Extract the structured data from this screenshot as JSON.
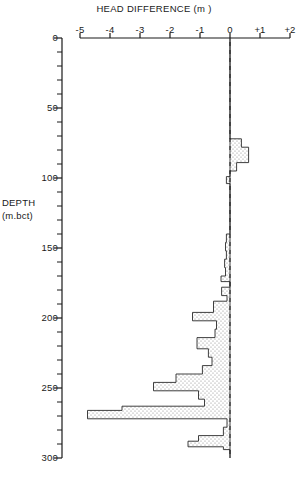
{
  "chart_data": {
    "type": "area",
    "title": "HEAD DIFFERENCE (m )",
    "xlabel": "HEAD DIFFERENCE (m )",
    "ylabel_line1": "DEPTH",
    "ylabel_line2": "(m.bct)",
    "xlim": [
      -5,
      2
    ],
    "ylim": [
      0,
      300
    ],
    "y_inverted": true,
    "grid": false,
    "legend": null,
    "xticks": [
      -5,
      -4,
      -3,
      -2,
      -1,
      0,
      1,
      2
    ],
    "xtick_labels": [
      "-5",
      "-4",
      "-3",
      "-2",
      "-1",
      "0",
      "+1",
      "+2"
    ],
    "yticks": [
      0,
      50,
      100,
      150,
      200,
      250,
      300
    ],
    "ytick_labels": [
      "0",
      "50",
      "100",
      "150",
      "200",
      "250",
      "300"
    ],
    "y_minor_tick_interval": 10,
    "reference_line": {
      "x": 0,
      "style": "dashed",
      "label": "zero head difference"
    },
    "fill_style": "stipple",
    "series_name": "head difference profile",
    "steps": [
      {
        "depth_top": 0,
        "depth_bottom": 72,
        "value": 0.0
      },
      {
        "depth_top": 72,
        "depth_bottom": 78,
        "value": 0.38
      },
      {
        "depth_top": 78,
        "depth_bottom": 89,
        "value": 0.62
      },
      {
        "depth_top": 89,
        "depth_bottom": 95,
        "value": 0.22
      },
      {
        "depth_top": 95,
        "depth_bottom": 99,
        "value": 0.0
      },
      {
        "depth_top": 99,
        "depth_bottom": 104,
        "value": -0.12
      },
      {
        "depth_top": 104,
        "depth_bottom": 140,
        "value": 0.0
      },
      {
        "depth_top": 140,
        "depth_bottom": 146,
        "value": -0.12
      },
      {
        "depth_top": 146,
        "depth_bottom": 152,
        "value": -0.15
      },
      {
        "depth_top": 152,
        "depth_bottom": 158,
        "value": -0.12
      },
      {
        "depth_top": 158,
        "depth_bottom": 164,
        "value": -0.18
      },
      {
        "depth_top": 164,
        "depth_bottom": 170,
        "value": -0.15
      },
      {
        "depth_top": 170,
        "depth_bottom": 174,
        "value": -0.3
      },
      {
        "depth_top": 174,
        "depth_bottom": 178,
        "value": 0.0
      },
      {
        "depth_top": 178,
        "depth_bottom": 184,
        "value": -0.28
      },
      {
        "depth_top": 184,
        "depth_bottom": 188,
        "value": -0.1
      },
      {
        "depth_top": 188,
        "depth_bottom": 196,
        "value": -0.55
      },
      {
        "depth_top": 196,
        "depth_bottom": 202,
        "value": -1.25
      },
      {
        "depth_top": 202,
        "depth_bottom": 208,
        "value": -0.45
      },
      {
        "depth_top": 208,
        "depth_bottom": 214,
        "value": -0.5
      },
      {
        "depth_top": 214,
        "depth_bottom": 222,
        "value": -1.1
      },
      {
        "depth_top": 222,
        "depth_bottom": 228,
        "value": -0.72
      },
      {
        "depth_top": 228,
        "depth_bottom": 234,
        "value": -0.6
      },
      {
        "depth_top": 234,
        "depth_bottom": 240,
        "value": -0.92
      },
      {
        "depth_top": 240,
        "depth_bottom": 246,
        "value": -1.8
      },
      {
        "depth_top": 246,
        "depth_bottom": 252,
        "value": -2.55
      },
      {
        "depth_top": 252,
        "depth_bottom": 258,
        "value": -1.05
      },
      {
        "depth_top": 258,
        "depth_bottom": 263,
        "value": -0.85
      },
      {
        "depth_top": 263,
        "depth_bottom": 266,
        "value": -3.6
      },
      {
        "depth_top": 266,
        "depth_bottom": 272,
        "value": -4.75
      },
      {
        "depth_top": 272,
        "depth_bottom": 278,
        "value": -0.1
      },
      {
        "depth_top": 278,
        "depth_bottom": 284,
        "value": -0.22
      },
      {
        "depth_top": 284,
        "depth_bottom": 288,
        "value": -1.05
      },
      {
        "depth_top": 288,
        "depth_bottom": 292,
        "value": -1.4
      },
      {
        "depth_top": 292,
        "depth_bottom": 294,
        "value": -0.22
      },
      {
        "depth_top": 294,
        "depth_bottom": 300,
        "value": 0.0
      }
    ]
  }
}
